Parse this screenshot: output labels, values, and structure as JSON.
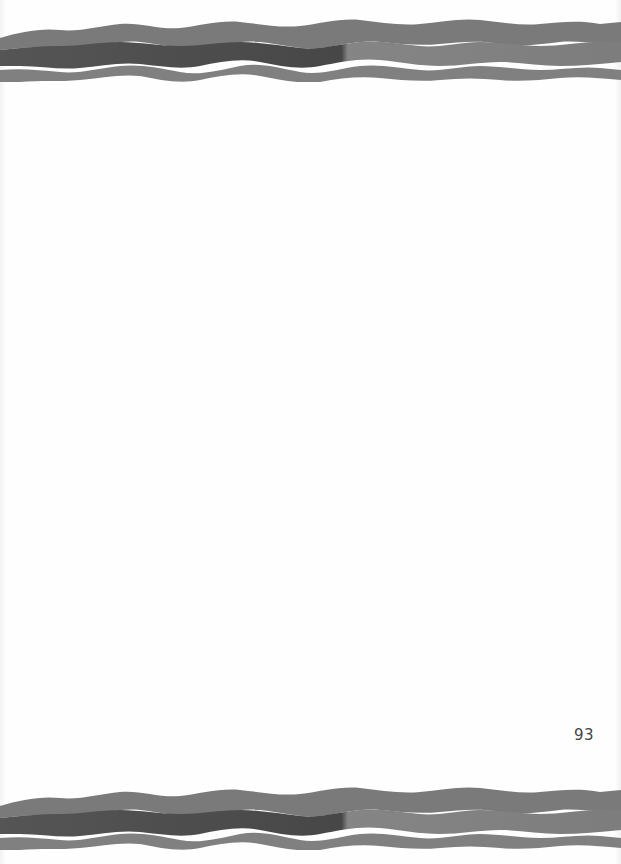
{
  "page": {
    "type": "scanned-book-page",
    "page_number": "93",
    "body_text": ""
  },
  "decorations": {
    "top_border": {
      "style": "wavy-watercolor-bands",
      "colors": {
        "outer_band": "#7a7a7a",
        "inner_dark_left": "#4a4a4a",
        "inner_light_right": "#808080",
        "stripe": "#f4f4f4"
      }
    },
    "bottom_border": {
      "style": "wavy-watercolor-bands",
      "colors": {
        "outer_band": "#7a7a7a",
        "inner_dark_left": "#4a4a4a",
        "inner_light_right": "#808080",
        "stripe": "#f4f4f4"
      }
    }
  }
}
